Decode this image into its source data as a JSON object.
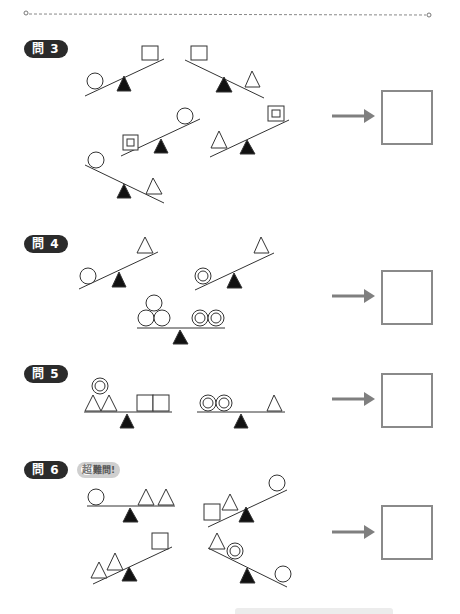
{
  "page": {
    "kind": "balance-scale worksheet"
  },
  "questions": [
    {
      "label": "問 3",
      "scales": 5,
      "answer_box": ""
    },
    {
      "label": "問 4",
      "scales": 3,
      "answer_box": ""
    },
    {
      "label": "問 5",
      "scales": 2,
      "answer_box": ""
    },
    {
      "label": "問 6",
      "badge_prefix": "超",
      "badge_text": "難問!",
      "scales": 4,
      "answer_box": ""
    }
  ],
  "colors": {
    "pill": "#2b2b2b",
    "arrow": "#7f7f7f",
    "box_border": "#8a8a8a",
    "fulcrum": "#111111"
  }
}
